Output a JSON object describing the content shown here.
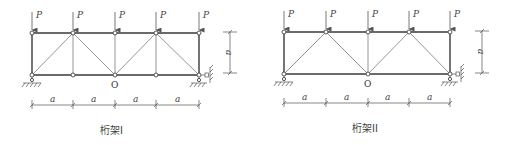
{
  "figure": {
    "trusses": [
      {
        "id": "truss-1",
        "caption": "桁架I",
        "load_label": "P",
        "span_label": "a",
        "height_label": "a",
        "center_node_label": "O",
        "panels": 4,
        "vertical_members_at_panel_points": [
          0,
          1,
          2,
          3,
          4
        ],
        "diagonals": "pratt-inverted: bottom-left to top-1, top-1 to O, O to top-3, top-3 to bottom-right",
        "supports": [
          "pin at bottom-left",
          "pin below bottom-right",
          "roller to right wall at bottom-right"
        ]
      },
      {
        "id": "truss-2",
        "caption": "桁架II",
        "load_label": "P",
        "span_label": "a",
        "height_label": "a",
        "center_node_label": "O",
        "panels": 4,
        "vertical_members_at_panel_points": [
          0,
          2,
          4
        ],
        "diagonals": "bottom-left to top-1, top-1 to O, O to top-3, top-3 to bottom-right",
        "supports": [
          "pin at bottom-left",
          "pin below bottom-right",
          "roller to right wall at bottom-right"
        ]
      }
    ]
  },
  "labels": {
    "t1": {
      "caption": "桁架I",
      "P": [
        "P",
        "P",
        "P",
        "P",
        "P"
      ],
      "dims": [
        "a",
        "a",
        "a",
        "a"
      ],
      "height": "a",
      "O": "O"
    },
    "t2": {
      "caption": "桁架II",
      "P": [
        "P",
        "P",
        "P",
        "P",
        "P"
      ],
      "dims": [
        "a",
        "a",
        "a",
        "a"
      ],
      "height": "a",
      "O": "O"
    }
  }
}
